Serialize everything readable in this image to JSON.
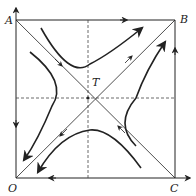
{
  "diagram": {
    "type": "phase-portrait",
    "labels": {
      "A": "A",
      "B": "B",
      "O": "O",
      "C": "C",
      "T": "T"
    },
    "colors": {
      "line": "#222222",
      "dashed": "#444444",
      "background": "#ffffff"
    }
  }
}
